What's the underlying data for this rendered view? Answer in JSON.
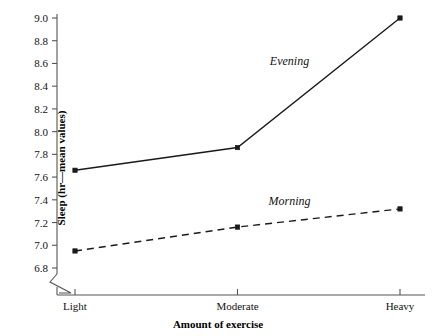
{
  "chart_data": {
    "type": "line",
    "title": "",
    "xlabel": "Amount of exercise",
    "ylabel": "Sleep (hr—mean values)",
    "categories": [
      "Light",
      "Moderate",
      "Heavy"
    ],
    "series": [
      {
        "name": "Evening",
        "values": [
          7.66,
          7.86,
          9.0
        ],
        "style": "solid",
        "color": "#1a1a1a",
        "marker": "square",
        "label_position": {
          "x": 0.66,
          "y": 8.62
        }
      },
      {
        "name": "Morning",
        "values": [
          6.95,
          7.16,
          7.32
        ],
        "style": "dashed",
        "color": "#1a1a1a",
        "marker": "square",
        "label_position": {
          "x": 0.66,
          "y": 7.39
        }
      }
    ],
    "ylim": [
      6.8,
      9.0
    ],
    "yticks": [
      6.8,
      7.0,
      7.2,
      7.4,
      7.6,
      7.8,
      8.0,
      8.2,
      8.4,
      8.6,
      8.8,
      9.0
    ],
    "ytick_labels": [
      "6.8",
      "7.0",
      "7.2",
      "7.4",
      "7.6",
      "7.8",
      "8.0",
      "8.2",
      "8.4",
      "8.6",
      "8.8",
      "9.0"
    ],
    "xtick_labels": [
      "Light",
      "Moderate",
      "Heavy"
    ],
    "grid": false,
    "legend": "inline-annotations",
    "axis_break": true,
    "background_color": "#ffffff",
    "axis_color": "#555555"
  }
}
